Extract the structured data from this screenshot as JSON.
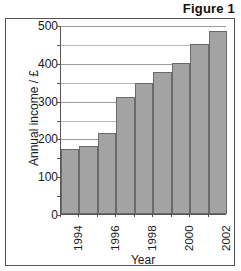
{
  "figure": {
    "title": "Figure 1"
  },
  "chart_data": {
    "type": "bar",
    "title": "Figure 1",
    "xlabel": "Year",
    "ylabel": "Annual income / £",
    "categories": [
      "1994",
      "1995",
      "1996",
      "1997",
      "1998",
      "1999",
      "2000",
      "2001",
      "2002"
    ],
    "values": [
      173,
      179,
      215,
      310,
      347,
      375,
      400,
      450,
      485
    ],
    "ylim": [
      0,
      500
    ],
    "y_ticks_labeled": [
      "0",
      "100",
      "200",
      "300",
      "400",
      "500"
    ],
    "y_tick_values_labeled": [
      0,
      100,
      200,
      300,
      400,
      500
    ],
    "y_minor_tick_interval": 50,
    "y_gridlines": [
      50,
      100,
      150,
      200,
      250,
      300,
      350,
      400,
      450,
      500
    ],
    "x_tick_labels_shown": [
      "1994",
      "1996",
      "1998",
      "2000",
      "2002"
    ],
    "x_tick_label_rotation": 90,
    "grid": true,
    "legend": false,
    "bar_fill_color": "#a3a3a3",
    "bar_border_color": "#6a6a6a",
    "axis_color": "#555555",
    "gridline_color": "#b9b9b9"
  }
}
